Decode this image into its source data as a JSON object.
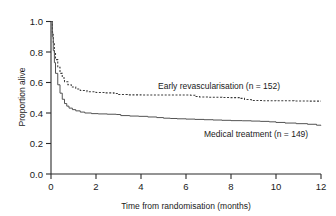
{
  "chart_data": {
    "type": "line",
    "title": "",
    "subtitle": "",
    "xlabel": "Time from randomisation (months)",
    "ylabel": "Proportion alive",
    "xlim": [
      0,
      12
    ],
    "ylim": [
      0.0,
      1.0
    ],
    "xticks": [
      0,
      2,
      4,
      6,
      8,
      10,
      12
    ],
    "xtick_labels": [
      "0",
      "2",
      "4",
      "6",
      "8",
      "10",
      "12"
    ],
    "yticks": [
      0.0,
      0.2,
      0.4,
      0.6,
      0.8,
      1.0
    ],
    "ytick_labels": [
      "0.0",
      "0.2",
      "0.4",
      "0.6",
      "0.8",
      "1.0"
    ],
    "grid": false,
    "legend_position": "inline-annotation",
    "series": [
      {
        "name": "Early revascularisation (n = 152)",
        "label": "Early revascularisation (n = 152)",
        "style": "dotted",
        "color": "#3a3a3a",
        "n": 152,
        "x": [
          0,
          0.06,
          0.1,
          0.15,
          0.2,
          0.3,
          0.4,
          0.5,
          0.6,
          0.75,
          0.9,
          1.1,
          1.3,
          1.6,
          2.0,
          2.4,
          2.8,
          3.0,
          3.4,
          4.0,
          4.6,
          5.2,
          5.8,
          6.2,
          6.4,
          6.6,
          7.0,
          7.6,
          8.0,
          8.4,
          8.6,
          8.9,
          9.4,
          10.0,
          10.8,
          11.5,
          12.0
        ],
        "y": [
          1.0,
          0.93,
          0.86,
          0.8,
          0.75,
          0.7,
          0.66,
          0.63,
          0.605,
          0.585,
          0.57,
          0.558,
          0.548,
          0.54,
          0.535,
          0.532,
          0.528,
          0.521,
          0.519,
          0.518,
          0.518,
          0.518,
          0.518,
          0.517,
          0.508,
          0.505,
          0.503,
          0.502,
          0.501,
          0.496,
          0.488,
          0.482,
          0.481,
          0.48,
          0.479,
          0.478,
          0.478
        ]
      },
      {
        "name": "Medical treatment (n = 149)",
        "label": "Medical treatment (n = 149)",
        "style": "solid",
        "color": "#4a4a4a",
        "n": 149,
        "x": [
          0,
          0.06,
          0.1,
          0.15,
          0.2,
          0.3,
          0.4,
          0.5,
          0.6,
          0.7,
          0.8,
          0.95,
          1.1,
          1.3,
          1.5,
          1.8,
          2.1,
          2.5,
          2.9,
          3.1,
          3.5,
          3.9,
          4.3,
          4.7,
          5.0,
          5.3,
          5.6,
          6.0,
          6.4,
          6.8,
          7.2,
          7.6,
          8.0,
          8.5,
          8.9,
          9.3,
          9.7,
          10.0,
          10.4,
          10.9,
          11.4,
          11.8,
          12.0
        ],
        "y": [
          1.0,
          0.9,
          0.81,
          0.73,
          0.66,
          0.585,
          0.53,
          0.49,
          0.462,
          0.445,
          0.432,
          0.422,
          0.414,
          0.406,
          0.4,
          0.396,
          0.394,
          0.392,
          0.39,
          0.383,
          0.38,
          0.378,
          0.374,
          0.37,
          0.366,
          0.364,
          0.362,
          0.36,
          0.358,
          0.356,
          0.354,
          0.352,
          0.35,
          0.349,
          0.347,
          0.345,
          0.342,
          0.338,
          0.334,
          0.33,
          0.326,
          0.32,
          0.318
        ]
      }
    ],
    "annotations": [
      {
        "text": "Early revascularisation (n = 152)",
        "x": 5.0,
        "y": 0.6,
        "series": "Early revascularisation (n = 152)"
      },
      {
        "text": "Medical treatment (n = 149)",
        "x": 6.9,
        "y": 0.255,
        "series": "Medical treatment (n = 149)"
      }
    ]
  },
  "axes": {
    "ylabel": "Proportion alive",
    "xlabel": "Time from randomisation (months)"
  }
}
